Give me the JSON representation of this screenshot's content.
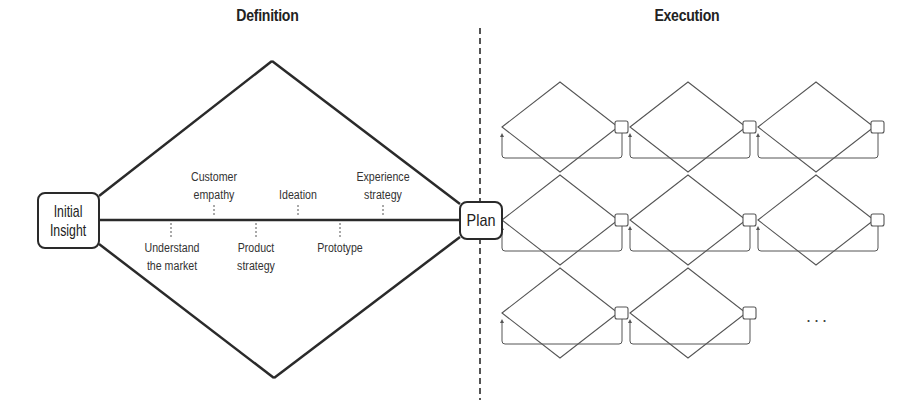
{
  "diagram": {
    "sections": {
      "definition": {
        "title": "Definition"
      },
      "execution": {
        "title": "Execution"
      }
    },
    "nodes": {
      "start": {
        "label": "Initial Insight",
        "lines": [
          "Initial",
          "Insight"
        ]
      },
      "end": {
        "label": "Plan"
      }
    },
    "definition_steps_above": [
      {
        "label": "Customer empathy",
        "lines": [
          "Customer",
          "empathy"
        ],
        "x": 214
      },
      {
        "label": "Ideation",
        "lines": [
          "Ideation"
        ],
        "x": 298
      },
      {
        "label": "Experience strategy",
        "lines": [
          "Experience",
          "strategy"
        ],
        "x": 383
      }
    ],
    "definition_steps_below": [
      {
        "label": "Understand the market",
        "lines": [
          "Understand",
          "the market"
        ],
        "x": 172
      },
      {
        "label": "Product strategy",
        "lines": [
          "Product",
          "strategy"
        ],
        "x": 256
      },
      {
        "label": "Prototype",
        "lines": [
          "Prototype"
        ],
        "x": 340
      }
    ],
    "execution_grid": {
      "rows": 3,
      "columns": 3,
      "cells": [
        [
          true,
          true,
          true
        ],
        [
          true,
          true,
          true
        ],
        [
          true,
          true,
          false
        ]
      ],
      "continuation": "..."
    },
    "colors": {
      "stroke": "#2a2a2a",
      "thin_stroke": "#555555",
      "background": "#ffffff"
    }
  }
}
